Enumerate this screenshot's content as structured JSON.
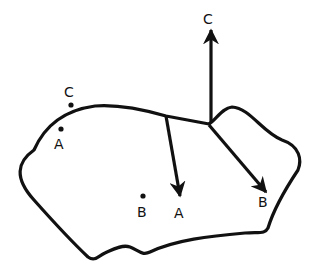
{
  "diagram": {
    "type": "force-vector diagram on an irregular outlined shape",
    "colors": {
      "stroke": "#111111",
      "background": "#ffffff"
    },
    "labels": {
      "point_c": "C",
      "point_a": "A",
      "point_b": "B",
      "arrow_c": "C",
      "arrow_a": "A",
      "arrow_b": "B"
    },
    "points": [
      {
        "name": "C",
        "x": 71,
        "y": 105,
        "label_x": 64,
        "label_y": 97
      },
      {
        "name": "A",
        "x": 61,
        "y": 129,
        "label_x": 54,
        "label_y": 149
      },
      {
        "name": "B",
        "x": 143,
        "y": 196,
        "label_x": 138,
        "label_y": 217
      }
    ],
    "arrows": [
      {
        "name": "C",
        "from": [
          211,
          123
        ],
        "to": [
          211,
          33
        ],
        "label_x": 203,
        "label_y": 25
      },
      {
        "name": "A",
        "from": [
          166,
          116
        ],
        "to": [
          180,
          194
        ],
        "label_x": 174,
        "label_y": 219
      },
      {
        "name": "B",
        "from": [
          209,
          125
        ],
        "to": [
          265,
          190
        ],
        "label_x": 258,
        "label_y": 208
      }
    ]
  }
}
